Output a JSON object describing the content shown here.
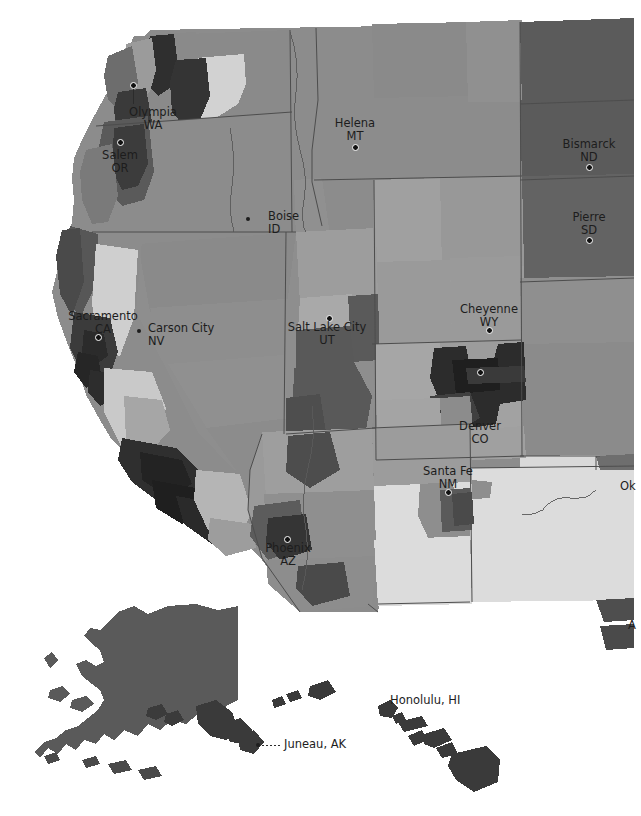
{
  "map": {
    "title": "United States choropleth map (western view)",
    "type": "choropleth",
    "projection": "albers-usa",
    "background_color": "#ffffff",
    "border_color": "#4a4a4a",
    "palette": {
      "lightest": "#e2e2e2",
      "lighter": "#d2d2d2",
      "light": "#c3c3c3",
      "mid_light": "#a8a8a8",
      "mid": "#8c8c8c",
      "mid_dark": "#777777",
      "dark": "#5e5e5e",
      "darker": "#4a4a4a",
      "darkest": "#2e2e2e"
    },
    "insets": [
      {
        "name": "alaska",
        "fill": "#5a5a5a"
      },
      {
        "name": "hawaii",
        "fill": "#3a3a3a"
      }
    ]
  },
  "cities": [
    {
      "id": "olympia",
      "name": "Olympia",
      "state": "WA",
      "label": "Olympia\nWA",
      "x": 153,
      "y": 112,
      "dot_x": 133,
      "dot_y": 85,
      "leader": true,
      "dot_style": "ring",
      "align": "center"
    },
    {
      "id": "salem",
      "name": "Salem",
      "state": "OR",
      "label": "Salem\nOR",
      "x": 120,
      "y": 155,
      "dot_x": 120,
      "dot_y": 142,
      "leader": false,
      "dot_style": "ring",
      "align": "center"
    },
    {
      "id": "boise",
      "name": "Boise",
      "state": "ID",
      "label": "Boise\nID",
      "x": 268,
      "y": 216,
      "dot_x": 248,
      "dot_y": 219,
      "leader": false,
      "dot_style": "solid",
      "align": "left"
    },
    {
      "id": "helena",
      "name": "Helena",
      "state": "MT",
      "label": "Helena\nMT",
      "x": 355,
      "y": 123,
      "dot_x": 355,
      "dot_y": 147,
      "leader": false,
      "dot_style": "ring",
      "align": "center"
    },
    {
      "id": "bismarck",
      "name": "Bismarck",
      "state": "ND",
      "label": "Bismarck\nND",
      "x": 589,
      "y": 144,
      "dot_x": 589,
      "dot_y": 167,
      "leader": false,
      "dot_style": "ring",
      "align": "center"
    },
    {
      "id": "pierre",
      "name": "Pierre",
      "state": "SD",
      "label": "Pierre\nSD",
      "x": 589,
      "y": 217,
      "dot_x": 589,
      "dot_y": 240,
      "leader": false,
      "dot_style": "ring",
      "align": "center"
    },
    {
      "id": "sacramento",
      "name": "Sacramento",
      "state": "CA",
      "label": "Sacramento\nCA",
      "x": 103,
      "y": 316,
      "dot_x": 98,
      "dot_y": 337,
      "leader": false,
      "dot_style": "ring",
      "align": "center"
    },
    {
      "id": "carson-city",
      "name": "Carson City",
      "state": "NV",
      "label": "Carson City\nNV",
      "x": 148,
      "y": 328,
      "dot_x": 139,
      "dot_y": 331,
      "leader": false,
      "dot_style": "solid",
      "align": "left"
    },
    {
      "id": "salt-lake-city",
      "name": "Salt Lake City",
      "state": "UT",
      "label": "Salt Lake City\nUT",
      "x": 327,
      "y": 327,
      "dot_x": 329,
      "dot_y": 318,
      "leader": false,
      "dot_style": "ring",
      "align": "center"
    },
    {
      "id": "cheyenne",
      "name": "Cheyenne",
      "state": "WY",
      "label": "Cheyenne\nWY",
      "x": 489,
      "y": 309,
      "dot_x": 489,
      "dot_y": 330,
      "leader": false,
      "dot_style": "ring",
      "align": "center"
    },
    {
      "id": "denver",
      "name": "Denver",
      "state": "CO",
      "label": "Denver\nCO",
      "x": 480,
      "y": 426,
      "dot_x": 480,
      "dot_y": 372,
      "leader": false,
      "dot_style": "ring",
      "align": "center"
    },
    {
      "id": "santa-fe",
      "name": "Santa Fe",
      "state": "NM",
      "label": "Santa Fe\nNM",
      "x": 448,
      "y": 471,
      "dot_x": 448,
      "dot_y": 492,
      "leader": false,
      "dot_style": "ring",
      "align": "center"
    },
    {
      "id": "phoenix",
      "name": "Phoenix",
      "state": "AZ",
      "label": "Phoenix\nAZ",
      "x": 288,
      "y": 548,
      "dot_x": 287,
      "dot_y": 539,
      "leader": false,
      "dot_style": "ring",
      "align": "center"
    },
    {
      "id": "oklahoma-city",
      "name": "Oklahoma City",
      "state": "OK",
      "label": "Ok",
      "x": 620,
      "y": 486,
      "dot_x": -99,
      "dot_y": -99,
      "leader": false,
      "dot_style": "none",
      "align": "left"
    },
    {
      "id": "austin",
      "name": "Austin",
      "state": "TX",
      "label": "A",
      "x": 628,
      "y": 625,
      "dot_x": -99,
      "dot_y": -99,
      "leader": false,
      "dot_style": "none",
      "align": "left"
    },
    {
      "id": "honolulu",
      "name": "Honolulu",
      "state": "HI",
      "label": "Honolulu, HI",
      "x": 390,
      "y": 700,
      "dot_x": -99,
      "dot_y": -99,
      "leader": false,
      "dot_style": "none",
      "align": "left"
    },
    {
      "id": "juneau",
      "name": "Juneau",
      "state": "AK",
      "label": "Juneau, AK",
      "x": 284,
      "y": 744,
      "dot_x": 258,
      "dot_y": 745,
      "leader": true,
      "dot_style": "solid",
      "align": "left"
    }
  ]
}
